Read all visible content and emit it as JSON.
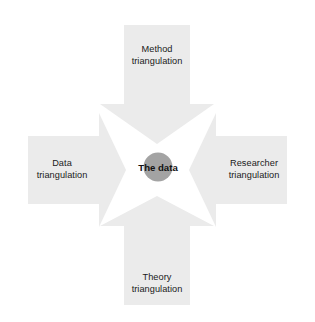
{
  "diagram": {
    "type": "converging-block-arrows",
    "center": {
      "label": "The data",
      "shape": "circle",
      "fill_color": "#a3a3a3"
    },
    "arrow_fill_color": "#ebebeb",
    "background_color": "#ffffff",
    "text_color": "#1a1a1a",
    "arrows": [
      {
        "id": "method",
        "direction": "down",
        "position": "top",
        "label_line_1": "Method",
        "label_line_2": "triangulation"
      },
      {
        "id": "data",
        "direction": "right",
        "position": "left",
        "label_line_1": "Data",
        "label_line_2": "triangulation"
      },
      {
        "id": "researcher",
        "direction": "left",
        "position": "right",
        "label_line_1": "Researcher",
        "label_line_2": "triangulation"
      },
      {
        "id": "theory",
        "direction": "up",
        "position": "bottom",
        "label_line_1": "Theory",
        "label_line_2": "triangulation"
      }
    ]
  }
}
